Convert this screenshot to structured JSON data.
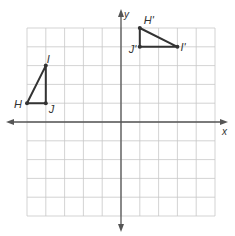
{
  "diagram": {
    "type": "coordinate-plane",
    "grid": {
      "x_min": -5,
      "x_max": 5,
      "y_min": -5,
      "y_max": 5,
      "unit_px": 18.8,
      "origin_px": [
        121,
        122
      ]
    },
    "axes": {
      "x_label": "x",
      "y_label": "y"
    },
    "colors": {
      "grid": "#c8c8c8",
      "axis": "#555555",
      "figure": "#333333",
      "label": "#333333"
    },
    "figures": [
      {
        "name": "triangle-HIJ",
        "points": [
          {
            "label": "H",
            "x": -5,
            "y": 1
          },
          {
            "label": "I",
            "x": -4,
            "y": 3
          },
          {
            "label": "J",
            "x": -4,
            "y": 1
          }
        ]
      },
      {
        "name": "triangle-H'I'J'",
        "points": [
          {
            "label": "H'",
            "x": 1,
            "y": 5
          },
          {
            "label": "I'",
            "x": 3,
            "y": 4
          },
          {
            "label": "J'",
            "x": 1,
            "y": 4
          }
        ]
      }
    ]
  }
}
